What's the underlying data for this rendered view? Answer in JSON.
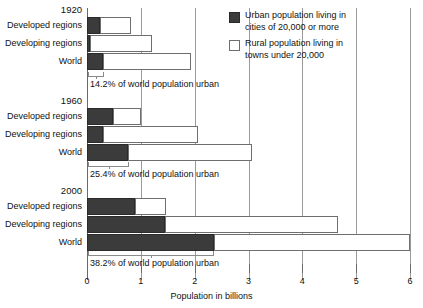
{
  "chart_data": {
    "type": "bar",
    "orientation": "horizontal",
    "stacked": true,
    "title": "",
    "xlabel": "Population in billions",
    "ylabel": "",
    "xlim": [
      0,
      6
    ],
    "xticks": [
      0,
      1,
      2,
      3,
      4,
      5,
      6
    ],
    "xtick_labels": [
      "0",
      "1",
      "2",
      "3",
      "4",
      "5",
      "6"
    ],
    "grid": true,
    "legend_position": "top-right",
    "series": [
      {
        "name": "Urban population living in cities of 20,000 or more",
        "color": "#3b3b3b",
        "values": [
          0.25,
          0.05,
          0.3,
          0.48,
          0.3,
          0.76,
          0.89,
          1.45,
          2.35
        ]
      },
      {
        "name": "Rural population living in towns under 20,000",
        "color": "#ffffff",
        "values": [
          0.57,
          1.15,
          1.64,
          0.52,
          1.76,
          2.3,
          0.58,
          3.21,
          3.65
        ]
      }
    ],
    "groups": [
      {
        "year": "1920",
        "caption": "14.2% of world population urban",
        "rows": [
          {
            "label": "Developed regions",
            "urban": 0.25,
            "rural_end": 0.82
          },
          {
            "label": "Developing regions",
            "urban": 0.05,
            "rural_end": 1.2
          },
          {
            "label": "World",
            "urban": 0.3,
            "rural_end": 1.94
          }
        ]
      },
      {
        "year": "1960",
        "caption": "25.4% of world population urban",
        "rows": [
          {
            "label": "Developed regions",
            "urban": 0.48,
            "rural_end": 1.0
          },
          {
            "label": "Developing regions",
            "urban": 0.3,
            "rural_end": 2.06
          },
          {
            "label": "World",
            "urban": 0.76,
            "rural_end": 3.06
          }
        ]
      },
      {
        "year": "2000",
        "caption": "38.2% of world population urban",
        "rows": [
          {
            "label": "Developed regions",
            "urban": 0.89,
            "rural_end": 1.47
          },
          {
            "label": "Developing regions",
            "urban": 1.45,
            "rural_end": 4.66
          },
          {
            "label": "World",
            "urban": 2.35,
            "rural_end": 6.0
          }
        ]
      }
    ]
  },
  "axis": {
    "xlabel": "Population in billions",
    "ticks": [
      "0",
      "1",
      "2",
      "3",
      "4",
      "5",
      "6"
    ]
  },
  "legend": {
    "items": [
      {
        "swatch": "urban",
        "text": "Urban population living in\ncities of 20,000 or more"
      },
      {
        "swatch": "rural",
        "text": "Rural population living in\ntowns under 20,000"
      }
    ]
  },
  "groups": {
    "g0": {
      "year": "1920",
      "caption": "14.2% of world population urban",
      "r0": "Developed regions",
      "r1": "Developing regions",
      "r2": "World"
    },
    "g1": {
      "year": "1960",
      "caption": "25.4% of world population urban",
      "r0": "Developed regions",
      "r1": "Developing regions",
      "r2": "World"
    },
    "g2": {
      "year": "2000",
      "caption": "38.2% of world population urban",
      "r0": "Developed regions",
      "r1": "Developing regions",
      "r2": "World"
    }
  }
}
